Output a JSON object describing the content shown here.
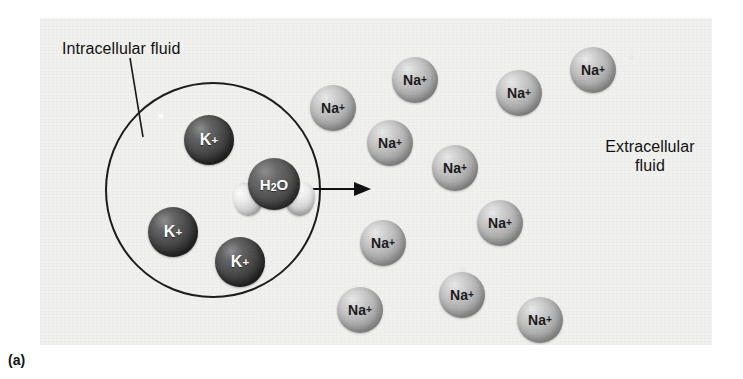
{
  "figure": {
    "caption": "(a)",
    "panel_background": "#f0f0ee",
    "title_concept": "Osmosis across a cell membrane"
  },
  "labels": {
    "intracellular": "Intracellular fluid",
    "extracellular": "Extracellular\nfluid"
  },
  "cell": {
    "membrane_color": "#1c1c1c",
    "center_x": 213,
    "center_y": 189,
    "radius": 108
  },
  "arrow": {
    "direction": "right",
    "meaning": "water movement out of cell",
    "color": "#111111"
  },
  "molecules": {
    "water": {
      "label": "H2O",
      "label_parts": {
        "h": "H",
        "sub": "2",
        "o": "O"
      },
      "oxygen_color": "#4a4a4a",
      "hydrogen_color": "#d8d8d8",
      "x": 258,
      "y": 183
    }
  },
  "ions": {
    "potassium": {
      "label": "K",
      "charge": "+",
      "color": "#474747",
      "text_color": "#ffffff",
      "diameter": 50,
      "count": 3,
      "location": "intracellular",
      "positions": [
        {
          "x": 209,
          "y": 140
        },
        {
          "x": 173,
          "y": 232
        },
        {
          "x": 240,
          "y": 262
        }
      ]
    },
    "sodium": {
      "label": "Na",
      "charge": "+",
      "color": "#b5b5b5",
      "text_color": "#1b1b1b",
      "diameter": 46,
      "count": 11,
      "location": "extracellular",
      "positions": [
        {
          "x": 333,
          "y": 108
        },
        {
          "x": 415,
          "y": 80
        },
        {
          "x": 390,
          "y": 143
        },
        {
          "x": 519,
          "y": 93
        },
        {
          "x": 593,
          "y": 70
        },
        {
          "x": 455,
          "y": 168
        },
        {
          "x": 500,
          "y": 223
        },
        {
          "x": 383,
          "y": 243
        },
        {
          "x": 360,
          "y": 310
        },
        {
          "x": 462,
          "y": 295
        },
        {
          "x": 540,
          "y": 320
        }
      ]
    }
  }
}
